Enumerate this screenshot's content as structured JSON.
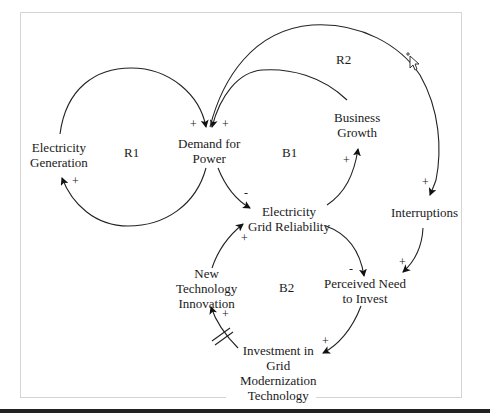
{
  "diagram": {
    "type": "causal-loop",
    "nodes": {
      "electricity_generation": {
        "line1": "Electricity",
        "line2": "Generation"
      },
      "demand_for_power": {
        "line1": "Demand for",
        "line2": "Power"
      },
      "business_growth": {
        "line1": "Business",
        "line2": "Growth"
      },
      "grid_reliability": {
        "line1": "Electricity",
        "line2": "Grid Reliability"
      },
      "interruptions": {
        "line1": "Interruptions"
      },
      "perceived_need": {
        "line1": "Perceived Need",
        "line2": "to Invest"
      },
      "new_tech_innovation": {
        "line1": "New",
        "line2": "Technology",
        "line3": "Innovation"
      },
      "investment": {
        "line1": "Investment in",
        "line2": "Grid",
        "line3": "Modernization",
        "line4": "Technology"
      }
    },
    "loops": {
      "r1": "R1",
      "r2": "R2",
      "b1": "B1",
      "b2": "B2"
    },
    "links": [
      {
        "from": "Electricity Generation",
        "to": "Demand for Power",
        "polarity": "+"
      },
      {
        "from": "Demand for Power",
        "to": "Electricity Generation",
        "polarity": "+"
      },
      {
        "from": "Business Growth",
        "to": "Demand for Power",
        "polarity": "+"
      },
      {
        "from": "Interruptions",
        "to": "Demand for Power",
        "polarity": "+"
      },
      {
        "from": "Demand for Power",
        "to": "Interruptions",
        "polarity": "+"
      },
      {
        "from": "Demand for Power",
        "to": "Electricity Grid Reliability",
        "polarity": "-"
      },
      {
        "from": "Electricity Grid Reliability",
        "to": "Business Growth",
        "polarity": "+"
      },
      {
        "from": "Electricity Grid Reliability",
        "to": "Perceived Need to Invest",
        "polarity": "-"
      },
      {
        "from": "Interruptions",
        "to": "Perceived Need to Invest",
        "polarity": "+"
      },
      {
        "from": "Perceived Need to Invest",
        "to": "Investment in Grid Modernization Technology",
        "polarity": "+"
      },
      {
        "from": "Investment in Grid Modernization Technology",
        "to": "New Technology Innovation",
        "polarity": "+",
        "delay": true
      },
      {
        "from": "New Technology Innovation",
        "to": "Electricity Grid Reliability",
        "polarity": "+"
      }
    ],
    "signs": {
      "plus": "+",
      "minus": "-"
    }
  }
}
